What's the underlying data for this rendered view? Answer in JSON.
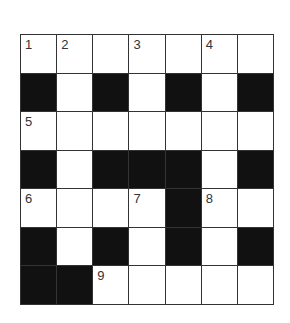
{
  "puzzle": {
    "rows": 7,
    "cols": 7,
    "colors": {
      "black": "#111111",
      "white": "#ffffff",
      "line": "#333333"
    },
    "grid": [
      [
        "W",
        "W",
        "W",
        "W",
        "W",
        "W",
        "W"
      ],
      [
        "B",
        "W",
        "B",
        "W",
        "B",
        "W",
        "B"
      ],
      [
        "W",
        "W",
        "W",
        "W",
        "W",
        "W",
        "W"
      ],
      [
        "B",
        "W",
        "B",
        "B",
        "B",
        "W",
        "B"
      ],
      [
        "W",
        "W",
        "W",
        "W",
        "B",
        "W",
        "W"
      ],
      [
        "B",
        "W",
        "B",
        "W",
        "B",
        "W",
        "B"
      ],
      [
        "B",
        "B",
        "W",
        "W",
        "W",
        "W",
        "W"
      ]
    ],
    "numbers": [
      {
        "row": 0,
        "col": 0,
        "n": "1"
      },
      {
        "row": 0,
        "col": 1,
        "n": "2"
      },
      {
        "row": 0,
        "col": 3,
        "n": "3"
      },
      {
        "row": 0,
        "col": 5,
        "n": "4"
      },
      {
        "row": 2,
        "col": 0,
        "n": "5"
      },
      {
        "row": 4,
        "col": 0,
        "n": "6"
      },
      {
        "row": 4,
        "col": 3,
        "n": "7"
      },
      {
        "row": 4,
        "col": 5,
        "n": "8"
      },
      {
        "row": 6,
        "col": 2,
        "n": "9"
      }
    ]
  }
}
